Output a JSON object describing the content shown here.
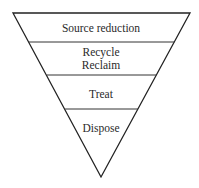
{
  "diagram": {
    "type": "inverted-pyramid",
    "levels": [
      {
        "lines": [
          "Source reduction"
        ]
      },
      {
        "lines": [
          "Recycle",
          "Reclaim"
        ]
      },
      {
        "lines": [
          "Treat"
        ]
      },
      {
        "lines": [
          "Dispose"
        ]
      }
    ],
    "colors": {
      "stroke": "#222222",
      "text": "#2a2a2a",
      "background": "#ffffff"
    }
  }
}
